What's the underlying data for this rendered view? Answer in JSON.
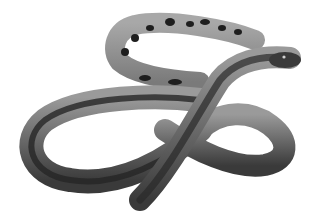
{
  "image": {
    "description": "Grayscale illustration of a coiled snake forming a loop, with a spotted tail section at top and head pointing right",
    "colors": {
      "background": "#ffffff",
      "body_light": "#8a8a8a",
      "body_mid": "#5e5e5e",
      "body_dark": "#262626",
      "spots": "#1e1e1e"
    }
  }
}
